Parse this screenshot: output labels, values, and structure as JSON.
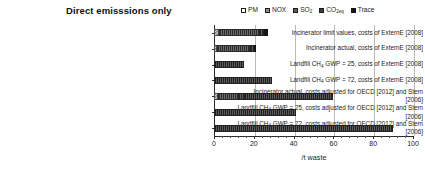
{
  "chart": {
    "title": "Direct emisssions only",
    "xlabel": "/t waste",
    "legend": [
      {
        "name": "PM",
        "label": "PM",
        "sub": "",
        "swatch": "legend-swatch-pm",
        "color": "#ffffff"
      },
      {
        "name": "NOX",
        "label": "NOX",
        "sub": "",
        "swatch": "legend-swatch-nox",
        "color": "#8f8f8f"
      },
      {
        "name": "SO2",
        "label": "SO",
        "sub": "2",
        "swatch": "legend-swatch-so2",
        "color": "#5d5d5d"
      },
      {
        "name": "CO2eq",
        "label": "CO",
        "sub": "2eq",
        "swatch": "legend-swatch-co2",
        "color": "#3a3a3a"
      },
      {
        "name": "Trace",
        "label": "Trace",
        "sub": "",
        "swatch": "legend-swatch-trace",
        "color": "#151515"
      }
    ],
    "xticks": [
      "0",
      "20",
      "40",
      "60",
      "80",
      "100"
    ]
  },
  "chart_data": {
    "type": "bar",
    "orientation": "horizontal",
    "stacked": true,
    "title": "Direct emisssions only",
    "xlabel": "/t waste",
    "ylabel": "",
    "xlim": [
      0,
      100
    ],
    "xticks": [
      0,
      20,
      40,
      60,
      80,
      100
    ],
    "grid": "vertical",
    "legend_position": "top-right",
    "legend": [
      "PM",
      "NOX",
      "SO2",
      "CO2eq",
      "Trace"
    ],
    "categories": [
      "Incinerator limit values, costs of ExternE [2008]",
      "Incinerator actual, costs of ExternE [2008]",
      "Landfill CH4 GWP = 25, costs of ExternE [2008]",
      "Landfill CH4 GWP = 72, costs of ExternE [2008]",
      "Incinerator actual, costs adjusted for OECD [2012] and Stern [2006]",
      "Landfill CH4 GWP = 25, costs adjusted for OECD [2012] and Stern [2006]",
      "Landfill CH4 GWP = 72, costs adjusted for OECD [2012] and Stern [2006]"
    ],
    "series": [
      {
        "name": "PM",
        "values": [
          2.5,
          1.5,
          0,
          0,
          2.0,
          0,
          0
        ]
      },
      {
        "name": "NOX",
        "values": [
          20,
          17,
          0,
          0,
          10,
          0,
          0
        ]
      },
      {
        "name": "SO2",
        "values": [
          2.5,
          2,
          0,
          0,
          3,
          0,
          0
        ]
      },
      {
        "name": "CO2eq",
        "values": [
          0,
          0,
          15,
          29,
          45,
          41,
          90
        ]
      },
      {
        "name": "Trace",
        "values": [
          2,
          0.5,
          0,
          0,
          0,
          0,
          0
        ]
      }
    ],
    "totals": [
      27,
      21,
      15,
      29,
      60,
      41,
      90
    ]
  },
  "categories": [
    {
      "lines": [
        {
          "pre": "Incinerator limit values, costs of ExternE [2008]",
          "sub": "",
          "post": ""
        }
      ],
      "total": 27,
      "segments": [
        {
          "cls": "seg-pm",
          "name": "bar-segment-pm",
          "width": 2.5
        },
        {
          "cls": "seg-nox",
          "name": "bar-segment-nox",
          "width": 20
        },
        {
          "cls": "seg-so2",
          "name": "bar-segment-so2",
          "width": 2.5
        },
        {
          "cls": "seg-trace",
          "name": "bar-segment-trace",
          "width": 2
        }
      ]
    },
    {
      "lines": [
        {
          "pre": "Incinerator actual, costs of ExternE [2008]",
          "sub": "",
          "post": ""
        }
      ],
      "total": 21,
      "segments": [
        {
          "cls": "seg-pm",
          "name": "bar-segment-pm",
          "width": 1.5
        },
        {
          "cls": "seg-nox",
          "name": "bar-segment-nox",
          "width": 17
        },
        {
          "cls": "seg-so2",
          "name": "bar-segment-so2",
          "width": 2
        },
        {
          "cls": "seg-trace",
          "name": "bar-segment-trace",
          "width": 0.5
        }
      ]
    },
    {
      "lines": [
        {
          "pre": "Landfill CH",
          "sub": "4",
          "post": " GWP = 25, costs of ExternE [2008]"
        }
      ],
      "total": 15,
      "segments": [
        {
          "cls": "seg-co2",
          "name": "bar-segment-co2",
          "width": 15
        }
      ]
    },
    {
      "lines": [
        {
          "pre": "Landfill CH",
          "sub": "4",
          "post": " GWP = 72, costs of ExternE [2008]"
        }
      ],
      "total": 29,
      "segments": [
        {
          "cls": "seg-co2",
          "name": "bar-segment-co2",
          "width": 29
        }
      ]
    },
    {
      "lines": [
        {
          "pre": "Incinerator actual, costs adjusted for OECD [2012] and Stern",
          "sub": "",
          "post": ""
        },
        {
          "pre": "[2006]",
          "sub": "",
          "post": ""
        }
      ],
      "total": 60,
      "segments": [
        {
          "cls": "seg-pm",
          "name": "bar-segment-pm",
          "width": 2
        },
        {
          "cls": "seg-nox",
          "name": "bar-segment-nox",
          "width": 10
        },
        {
          "cls": "seg-so2",
          "name": "bar-segment-so2",
          "width": 3
        },
        {
          "cls": "seg-co2",
          "name": "bar-segment-co2",
          "width": 45
        }
      ]
    },
    {
      "lines": [
        {
          "pre": "Landfill  CH",
          "sub": "4",
          "post": " GWP = 25, costs adjusted for OECD [2012] and Stern"
        },
        {
          "pre": "[2006]",
          "sub": "",
          "post": ""
        }
      ],
      "total": 41,
      "segments": [
        {
          "cls": "seg-co2",
          "name": "bar-segment-co2",
          "width": 41
        }
      ]
    },
    {
      "lines": [
        {
          "pre": "Landfill CH",
          "sub": "4",
          "post": " GWP = 72, costs adjusted for OECD [2012] and Stern"
        },
        {
          "pre": "[2006]",
          "sub": "",
          "post": ""
        }
      ],
      "total": 90,
      "segments": [
        {
          "cls": "seg-co2",
          "name": "bar-segment-co2",
          "width": 90
        }
      ]
    }
  ]
}
